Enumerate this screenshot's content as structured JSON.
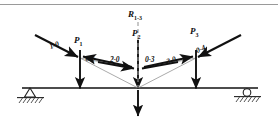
{
  "figure": {
    "colors": {
      "ink": "#111111",
      "thin_ray": "#8d8d8d",
      "dashed_line": "#9a9a9a",
      "background": "#ffffff",
      "rule": "#9a9a9a"
    },
    "beam": {
      "y": 88,
      "x_left": 22,
      "x_right": 258
    },
    "supports": [
      {
        "name": "pin-support",
        "type": "pinned",
        "x": 30,
        "y": 88
      },
      {
        "name": "roller-support",
        "type": "roller",
        "x": 247,
        "y": 88
      }
    ]
  },
  "loads": [
    {
      "id": "P1",
      "label": "P",
      "sub": "1",
      "x": 80,
      "head_y": 58,
      "tip_y": 90
    },
    {
      "id": "P2",
      "label": "P",
      "sub": "2",
      "x": 138,
      "head_y": 47,
      "tip_y": 90
    },
    {
      "id": "P3",
      "label": "P",
      "sub": "3",
      "x": 196,
      "head_y": 58,
      "tip_y": 90
    }
  ],
  "resultant": {
    "id": "R13",
    "label": "R",
    "sub": "1-3",
    "x": 138,
    "dashed_top_y": 22,
    "dashed_bottom_y": 88,
    "arrow_top_y": 92,
    "arrow_tip_y": 118
  },
  "segments": [
    {
      "id": "ray-1-0",
      "label": "1-0"
    },
    {
      "id": "ray-0-2",
      "label": "0-2"
    },
    {
      "id": "ray-2-0",
      "label": "2-0"
    },
    {
      "id": "ray-0-3",
      "label": "0-3"
    },
    {
      "id": "ray-3-0",
      "label": "3-0"
    },
    {
      "id": "ray-0-4",
      "label": "0-4"
    }
  ],
  "labels": {
    "p1": "P",
    "p1_sub": "1",
    "p2": "P",
    "p2_sub": "2",
    "p3": "P",
    "p3_sub": "3",
    "r": "R",
    "r_sub": "1-3",
    "s10": "1-0",
    "s02": "0-2",
    "s20": "2-0",
    "s03": "0-3",
    "s30": "3-0",
    "s04": "0-4"
  }
}
